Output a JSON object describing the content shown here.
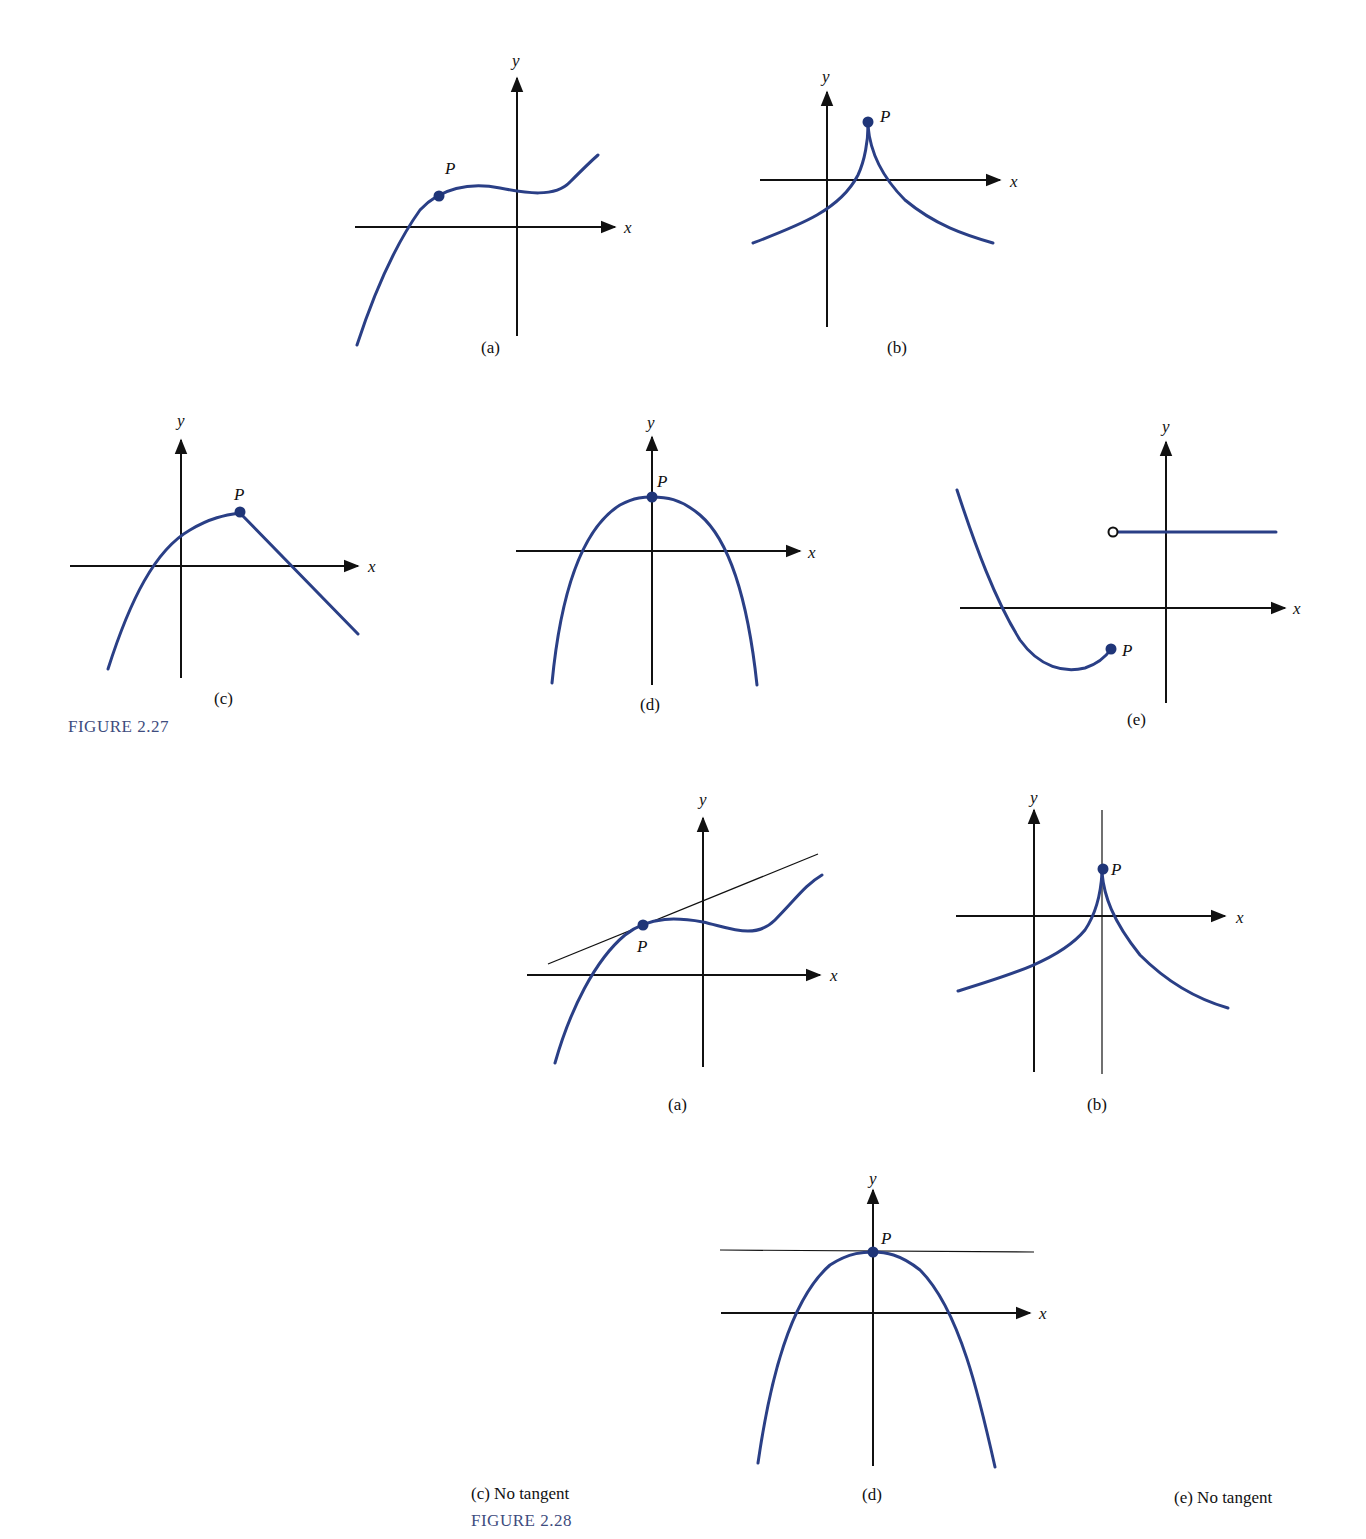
{
  "figure_2_27": {
    "title": "FIGURE 2.27",
    "panels": [
      {
        "id": "a",
        "caption": "(a)",
        "point_label": "P",
        "x_label": "x",
        "y_label": "y",
        "description": "Smooth cubic-like curve, P on the rising part left of y-axis"
      },
      {
        "id": "b",
        "caption": "(b)",
        "point_label": "P",
        "x_label": "x",
        "y_label": "y",
        "description": "Cusp at P above the x-axis, right of y-axis"
      },
      {
        "id": "c",
        "caption": "(c)",
        "point_label": "P",
        "x_label": "x",
        "y_label": "y",
        "description": "Curve with corner at P, line descending to the right"
      },
      {
        "id": "d",
        "caption": "(d)",
        "point_label": "P",
        "x_label": "x",
        "y_label": "y",
        "description": "Downward parabola with vertex P on the y-axis"
      },
      {
        "id": "e",
        "caption": "(e)",
        "point_label": "P",
        "x_label": "x",
        "y_label": "y",
        "description": "Discontinuous: curve ends at closed point P, open circle starts horizontal line"
      }
    ]
  },
  "figure_2_28": {
    "title": "FIGURE 2.28",
    "panels": [
      {
        "id": "a",
        "caption": "(a)",
        "point_label": "P",
        "x_label": "x",
        "y_label": "y",
        "description": "Tangent line drawn through P"
      },
      {
        "id": "b",
        "caption": "(b)",
        "point_label": "P",
        "x_label": "x",
        "y_label": "y",
        "description": "Vertical tangent line through cusp P"
      },
      {
        "id": "c",
        "caption": "(c)  No tangent"
      },
      {
        "id": "d",
        "caption": "(d)",
        "point_label": "P",
        "x_label": "x",
        "y_label": "y",
        "description": "Horizontal tangent line through vertex P"
      },
      {
        "id": "e",
        "caption": "(e)  No tangent"
      }
    ]
  },
  "colors": {
    "curve": "#2a3f86",
    "point": "#1f3578",
    "axis": "#111111",
    "figure_title": "#3e4c7e"
  }
}
